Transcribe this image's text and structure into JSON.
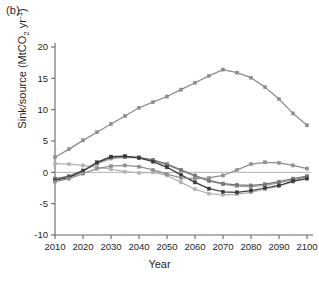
{
  "panel": {
    "label": "(b)"
  },
  "chart_data": {
    "type": "line",
    "title": "",
    "subtitle": "",
    "xlabel": "Year",
    "ylabel": "Sink/source (MtCO2 yr-1)",
    "ylabel_parts": {
      "prefix": "Sink/source (MtCO",
      "sub": "2",
      "mid": " yr",
      "sup": "-1",
      "suffix": ")"
    },
    "grid": false,
    "legend": "none",
    "zero_line": true,
    "x": [
      2010,
      2015,
      2020,
      2025,
      2030,
      2035,
      2040,
      2045,
      2050,
      2055,
      2060,
      2065,
      2070,
      2075,
      2080,
      2085,
      2090,
      2095,
      2100
    ],
    "xlim": [
      2010,
      2100
    ],
    "ylim": [
      -10,
      20
    ],
    "xticks": [
      2010,
      2020,
      2030,
      2040,
      2050,
      2060,
      2070,
      2080,
      2090,
      2100
    ],
    "xticklabels": [
      "2010",
      "2020",
      "2030",
      "2040",
      "2050",
      "2060",
      "2070",
      "2080",
      "2090",
      "2100"
    ],
    "yticks": [
      -10,
      -5,
      0,
      5,
      10,
      15,
      20
    ],
    "yticklabels": [
      "-10",
      "-5",
      "0",
      "5",
      "10",
      "15",
      "20"
    ],
    "series": [
      {
        "name": "series-1",
        "color": "#8c8c8c",
        "marker": "square",
        "values": [
          2.4,
          3.7,
          5.1,
          6.4,
          7.7,
          9.0,
          10.3,
          11.2,
          12.1,
          13.2,
          14.3,
          15.4,
          16.4,
          15.9,
          15.1,
          13.6,
          11.7,
          9.4,
          7.5
        ]
      },
      {
        "name": "series-2",
        "color": "#b3b3b3",
        "marker": "square",
        "values": [
          1.4,
          1.3,
          1.1,
          0.8,
          0.5,
          0.1,
          -0.1,
          0.0,
          -0.5,
          -1.6,
          -2.7,
          -3.4,
          -3.6,
          -3.5,
          -3.2,
          -2.7,
          -2.2,
          -1.5,
          -0.9
        ]
      },
      {
        "name": "series-3",
        "color": "#9a9a9a",
        "marker": "square",
        "values": [
          -1.1,
          -0.7,
          0.2,
          1.4,
          2.2,
          2.4,
          2.3,
          1.9,
          1.2,
          0.3,
          -0.6,
          -1.4,
          -1.9,
          -2.2,
          -2.3,
          -2.1,
          -1.7,
          -1.2,
          -0.7
        ]
      },
      {
        "name": "series-4",
        "color": "#777777",
        "marker": "square",
        "values": [
          -1.0,
          -0.6,
          0.3,
          1.5,
          2.4,
          2.5,
          2.4,
          2.0,
          1.3,
          0.4,
          -0.5,
          -1.3,
          -1.8,
          -2.0,
          -2.1,
          -1.9,
          -1.5,
          -1.0,
          -0.6
        ]
      },
      {
        "name": "series-5",
        "color": "#3a3a3a",
        "marker": "square",
        "values": [
          -1.3,
          -0.8,
          0.2,
          1.6,
          2.5,
          2.6,
          2.3,
          1.7,
          0.8,
          -0.4,
          -1.6,
          -2.6,
          -3.1,
          -3.2,
          -2.9,
          -2.5,
          -2.1,
          -1.4,
          -1.0
        ]
      },
      {
        "name": "series-6",
        "color": "#8f8f8f",
        "marker": "square",
        "values": [
          -1.5,
          -1.0,
          -0.2,
          0.6,
          1.0,
          1.1,
          0.9,
          0.4,
          -0.3,
          -0.9,
          -1.0,
          -0.9,
          -0.5,
          0.4,
          1.3,
          1.6,
          1.5,
          1.1,
          0.6
        ]
      }
    ]
  }
}
